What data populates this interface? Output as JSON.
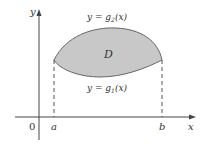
{
  "diagram": {
    "type": "region-between-curves",
    "axes": {
      "x_label": "x",
      "y_label": "y",
      "origin_label": "0"
    },
    "interval": {
      "left_label": "a",
      "right_label": "b"
    },
    "region_label": "D",
    "upper_curve": {
      "prefix": "y = g",
      "subscript": "2",
      "suffix": "(x)"
    },
    "lower_curve": {
      "prefix": "y = g",
      "subscript": "1",
      "suffix": "(x)"
    },
    "colors": {
      "region_fill": "#c8c8c8",
      "stroke": "#555555",
      "axis": "#444444"
    }
  }
}
